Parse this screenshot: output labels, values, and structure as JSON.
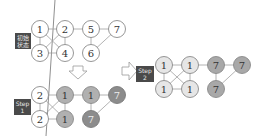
{
  "labels": {
    "initial_line1": "初始",
    "initial_line2": "状态",
    "step1_line1": "Step",
    "step1_line2": "1",
    "step2_line1": "Step",
    "step2_line2": "2"
  },
  "colors": {
    "white_fill": "#ffffff",
    "light_fill": "#e6e6e6",
    "mid_fill": "#a8a8a8",
    "dark_fill": "#8c8c8c",
    "stroke": "#8a8a8a",
    "edge": "#999999",
    "label_bg": "#4a4a4a"
  },
  "graphs": {
    "initial": {
      "nodes": [
        {
          "id": "n1",
          "label": "1",
          "x": 40,
          "y": 29,
          "fill": "white"
        },
        {
          "id": "n2",
          "label": "2",
          "x": 65,
          "y": 29,
          "fill": "white"
        },
        {
          "id": "n5",
          "label": "5",
          "x": 91,
          "y": 29,
          "fill": "white"
        },
        {
          "id": "n7",
          "label": "7",
          "x": 117,
          "y": 29,
          "fill": "white"
        },
        {
          "id": "n3",
          "label": "3",
          "x": 40,
          "y": 53,
          "fill": "white"
        },
        {
          "id": "n4",
          "label": "4",
          "x": 65,
          "y": 53,
          "fill": "white"
        },
        {
          "id": "n6",
          "label": "6",
          "x": 91,
          "y": 53,
          "fill": "white"
        }
      ]
    },
    "step1": {
      "nodes": [
        {
          "id": "a",
          "label": "2",
          "x": 40,
          "y": 95,
          "fill": "white"
        },
        {
          "id": "b",
          "label": "1",
          "x": 65,
          "y": 95,
          "fill": "mid"
        },
        {
          "id": "c",
          "label": "1",
          "x": 91,
          "y": 95,
          "fill": "mid"
        },
        {
          "id": "d",
          "label": "7",
          "x": 117,
          "y": 95,
          "fill": "dark"
        },
        {
          "id": "e",
          "label": "2",
          "x": 40,
          "y": 119,
          "fill": "white"
        },
        {
          "id": "f",
          "label": "1",
          "x": 65,
          "y": 119,
          "fill": "mid"
        },
        {
          "id": "g",
          "label": "7",
          "x": 91,
          "y": 119,
          "fill": "dark"
        }
      ]
    },
    "step2": {
      "nodes": [
        {
          "id": "a",
          "label": "1",
          "x": 164,
          "y": 65,
          "fill": "light"
        },
        {
          "id": "b",
          "label": "1",
          "x": 190,
          "y": 65,
          "fill": "light"
        },
        {
          "id": "c",
          "label": "7",
          "x": 216,
          "y": 65,
          "fill": "mid"
        },
        {
          "id": "d",
          "label": "7",
          "x": 242,
          "y": 65,
          "fill": "mid"
        },
        {
          "id": "e",
          "label": "1",
          "x": 164,
          "y": 89,
          "fill": "light"
        },
        {
          "id": "f",
          "label": "1",
          "x": 190,
          "y": 89,
          "fill": "light"
        },
        {
          "id": "g",
          "label": "7",
          "x": 216,
          "y": 89,
          "fill": "mid"
        }
      ]
    }
  }
}
